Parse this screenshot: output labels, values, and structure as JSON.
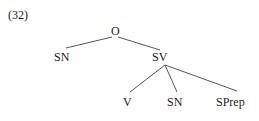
{
  "example_number": "(32)",
  "tree": {
    "root": {
      "label": "O",
      "x": 115,
      "y": 28,
      "children": [
        {
          "label": "SN",
          "x": 55,
          "y": 51
        },
        {
          "label": "SV",
          "x": 152,
          "y": 51,
          "children": [
            {
              "label": "V",
              "x": 123,
              "y": 96
            },
            {
              "label": "SN",
              "x": 167,
              "y": 96
            },
            {
              "label": "SPrep",
              "x": 216,
              "y": 96
            }
          ]
        }
      ]
    }
  },
  "labels": {
    "root": "O",
    "sn_left": "SN",
    "sv": "SV",
    "v": "V",
    "sn_right": "SN",
    "sprep": "SPrep"
  },
  "colors": {
    "text": "#1a1a1a",
    "edge": "#555555",
    "background": "#ffffff"
  }
}
